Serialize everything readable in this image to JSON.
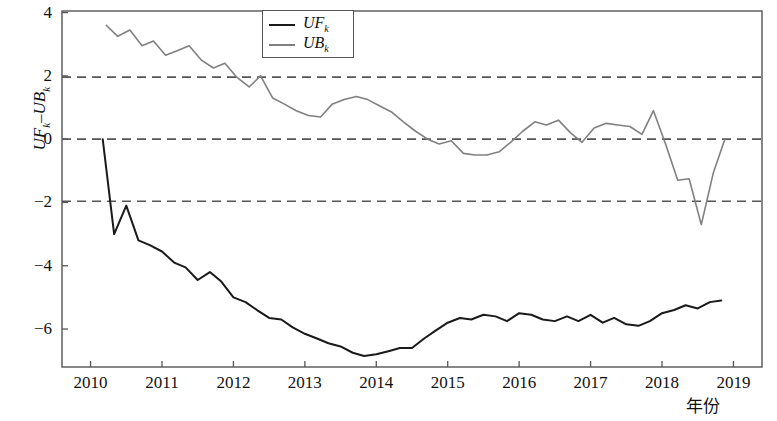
{
  "chart_data": {
    "type": "line",
    "title": "",
    "xlabel": "年份",
    "ylabel": "UF_k－UB_k",
    "ylabel_parts": {
      "a_main": "UF",
      "a_sub": "k",
      "dash": "–",
      "b_main": "UB",
      "b_sub": "k"
    },
    "xlim": [
      2009.6,
      2019.4
    ],
    "ylim": [
      -7.2,
      4.05
    ],
    "xticks": [
      2010,
      2011,
      2012,
      2013,
      2014,
      2015,
      2016,
      2017,
      2018,
      2019
    ],
    "xticklabels": [
      "2010",
      "2011",
      "2012",
      "2013",
      "2014",
      "2015",
      "2016",
      "2017",
      "2018",
      "2019"
    ],
    "yticks": [
      4,
      2,
      0,
      -2,
      -4,
      -6
    ],
    "yticklabels": [
      "4",
      "2",
      "0",
      "−2",
      "−4",
      "−6"
    ],
    "grid": false,
    "legend_position": "top-center",
    "reference_lines": [
      {
        "value": 1.96,
        "style": "dashed",
        "color": "#555555"
      },
      {
        "value": 0,
        "style": "dashed",
        "color": "#555555"
      },
      {
        "value": -1.96,
        "style": "dashed",
        "color": "#555555"
      }
    ],
    "series": [
      {
        "name": "UF_k",
        "legend_main": "UF",
        "legend_sub": "k",
        "color": "#1a1a1a",
        "width": 2.0,
        "x": [
          2010.17,
          2010.33,
          2010.5,
          2010.67,
          2010.83,
          2011.0,
          2011.17,
          2011.33,
          2011.5,
          2011.67,
          2011.83,
          2012.0,
          2012.17,
          2012.33,
          2012.5,
          2012.67,
          2012.83,
          2013.0,
          2013.17,
          2013.33,
          2013.5,
          2013.67,
          2013.83,
          2014.0,
          2014.17,
          2014.33,
          2014.5,
          2014.67,
          2014.83,
          2015.0,
          2015.17,
          2015.33,
          2015.5,
          2015.67,
          2015.83,
          2016.0,
          2016.17,
          2016.33,
          2016.5,
          2016.67,
          2016.83,
          2017.0,
          2017.17,
          2017.33,
          2017.5,
          2017.67,
          2017.83,
          2018.0,
          2018.17,
          2018.33,
          2018.5,
          2018.67,
          2018.83
        ],
        "y": [
          0.0,
          -3.0,
          -2.1,
          -3.2,
          -3.35,
          -3.55,
          -3.9,
          -4.05,
          -4.45,
          -4.2,
          -4.5,
          -5.0,
          -5.15,
          -5.4,
          -5.65,
          -5.7,
          -5.95,
          -6.15,
          -6.3,
          -6.45,
          -6.55,
          -6.75,
          -6.85,
          -6.8,
          -6.7,
          -6.6,
          -6.6,
          -6.3,
          -6.05,
          -5.8,
          -5.65,
          -5.7,
          -5.55,
          -5.6,
          -5.75,
          -5.5,
          -5.55,
          -5.7,
          -5.75,
          -5.6,
          -5.75,
          -5.55,
          -5.8,
          -5.65,
          -5.85,
          -5.9,
          -5.75,
          -5.5,
          -5.4,
          -5.25,
          -5.35,
          -5.15,
          -5.1
        ]
      },
      {
        "name": "UB_k",
        "legend_main": "UB",
        "legend_sub": "k",
        "color": "#808080",
        "width": 1.6,
        "x": [
          2010.22,
          2010.38,
          2010.55,
          2010.72,
          2010.88,
          2011.05,
          2011.22,
          2011.38,
          2011.55,
          2011.72,
          2011.88,
          2012.05,
          2012.22,
          2012.38,
          2012.55,
          2012.72,
          2012.88,
          2013.05,
          2013.22,
          2013.38,
          2013.55,
          2013.72,
          2013.88,
          2014.05,
          2014.22,
          2014.38,
          2014.55,
          2014.72,
          2014.88,
          2015.05,
          2015.22,
          2015.38,
          2015.55,
          2015.72,
          2015.88,
          2016.05,
          2016.22,
          2016.38,
          2016.55,
          2016.72,
          2016.88,
          2017.05,
          2017.22,
          2017.38,
          2017.55,
          2017.72,
          2017.88,
          2018.05,
          2018.22,
          2018.38,
          2018.55,
          2018.72,
          2018.88
        ],
        "y": [
          3.6,
          3.25,
          3.45,
          2.95,
          3.1,
          2.65,
          2.8,
          2.95,
          2.5,
          2.25,
          2.4,
          1.95,
          1.65,
          2.0,
          1.3,
          1.1,
          0.9,
          0.75,
          0.7,
          1.1,
          1.25,
          1.35,
          1.25,
          1.05,
          0.85,
          0.55,
          0.25,
          0.0,
          -0.15,
          -0.05,
          -0.45,
          -0.5,
          -0.5,
          -0.4,
          -0.1,
          0.25,
          0.55,
          0.45,
          0.6,
          0.2,
          -0.1,
          0.35,
          0.5,
          0.45,
          0.4,
          0.15,
          0.9,
          -0.15,
          -1.3,
          -1.25,
          -2.7,
          -1.05,
          0.0
        ]
      }
    ]
  },
  "legend": {
    "items": [
      {
        "label_main": "UF",
        "label_sub": "k",
        "color": "#1a1a1a"
      },
      {
        "label_main": "UB",
        "label_sub": "k",
        "color": "#808080"
      }
    ]
  },
  "axes": {
    "frame_color": "#555555",
    "tick_color": "#555555"
  }
}
